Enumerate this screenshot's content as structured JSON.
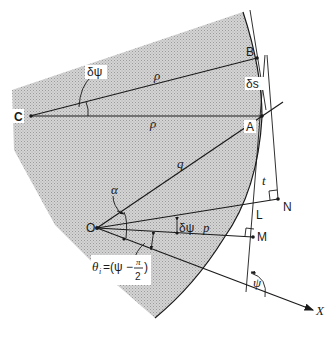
{
  "figure": {
    "shading_color": "#c8c8c8",
    "line_color": "#1a1a1a"
  },
  "points": {
    "C": "C",
    "B": "B",
    "A": "A",
    "O": "O",
    "N": "N",
    "L": "L",
    "M": "M",
    "X": "X"
  },
  "labels": {
    "delta_psi_top": "δψ",
    "rho_upper": "ρ",
    "rho_lower": "ρ",
    "delta_s": "δs",
    "q": "q",
    "t": "t",
    "alpha": "α",
    "delta_psi_mid": "δψ",
    "p": "p",
    "psi": "ψ",
    "theta_formula": "θ",
    "theta_sub": "i",
    "theta_eq": "=(ψ −",
    "pi": "π",
    "two": "2",
    "close_paren": ")"
  }
}
